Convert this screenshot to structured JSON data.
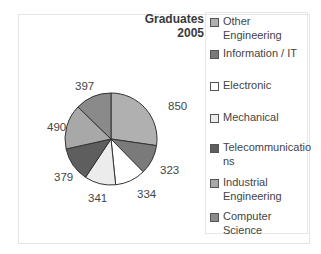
{
  "chart_data": {
    "type": "pie",
    "title": "Graduates 2005",
    "categories": [
      "Other Engineering",
      "Information / IT",
      "Electronic",
      "Mechanical",
      "Telecommunications",
      "Industrial Engineering",
      "Computer Science"
    ],
    "values": [
      850,
      323,
      334,
      341,
      379,
      490,
      397
    ],
    "colors": [
      "#b0b0b0",
      "#7a7a7a",
      "#ffffff",
      "#ececec",
      "#5e5e5e",
      "#a8a8a8",
      "#8a8a8a"
    ],
    "legend_position": "right"
  },
  "legend": [
    {
      "label": "Other Engineering",
      "color": "#b0b0b0"
    },
    {
      "label": "Information / IT",
      "color": "#7a7a7a"
    },
    {
      "label": "Electronic",
      "color": "#ffffff"
    },
    {
      "label": "Mechanical",
      "color": "#ececec"
    },
    {
      "label": "Telecommunicatio ns",
      "color": "#5e5e5e"
    },
    {
      "label": "Industrial Engineering",
      "color": "#a8a8a8"
    },
    {
      "label": "Computer Science",
      "color": "#8a8a8a"
    }
  ],
  "labels": {
    "l850": "850",
    "l323": "323",
    "l334": "334",
    "l341": "341",
    "l379": "379",
    "l490": "490",
    "l397": "397"
  }
}
